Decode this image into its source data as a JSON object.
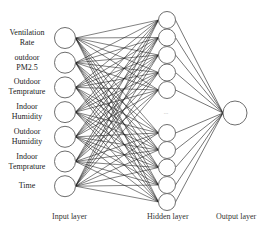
{
  "diagram": {
    "type": "neural-network",
    "layers": [
      {
        "name": "Input layer",
        "nodes": [
          {
            "label": "Ventilation Rate",
            "lines": [
              "Ventilation",
              "Rate"
            ]
          },
          {
            "label": "outdoor PM2.5",
            "lines": [
              "outdoor",
              "PM2.5"
            ]
          },
          {
            "label": "Outdoor Temprature",
            "lines": [
              "Outdoor",
              "Temprature"
            ]
          },
          {
            "label": "Indoor Humidity",
            "lines": [
              "Indoor",
              "Humidity"
            ]
          },
          {
            "label": "Outdoor Humidity",
            "lines": [
              "Outdoor",
              "Humidity"
            ]
          },
          {
            "label": "Indoor Temprature",
            "lines": [
              "Indoor",
              "Temprature"
            ]
          },
          {
            "label": "Time",
            "lines": [
              "Time"
            ]
          }
        ]
      },
      {
        "name": "Hidden layer",
        "node_count": 10,
        "ellipsis": "..."
      },
      {
        "name": "Output layer",
        "node_count": 1
      }
    ],
    "connections": "fully-connected",
    "colors": {
      "node_stroke": "#6e6e6e",
      "edge": "#1a1a1a",
      "background": "#ffffff"
    }
  }
}
